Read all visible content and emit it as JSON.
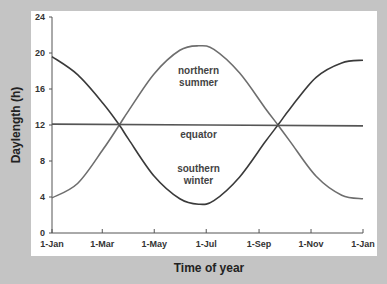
{
  "chart_data": {
    "type": "line",
    "title": "",
    "xlabel": "Time of year",
    "ylabel": "Daylength (h)",
    "x_tick_labels": [
      "1-Jan",
      "1-Mar",
      "1-May",
      "1-Jul",
      "1-Sep",
      "1-Nov",
      "1-Jan"
    ],
    "x_tick_days": [
      0,
      59,
      120,
      181,
      243,
      304,
      365
    ],
    "xlim": [
      0,
      365
    ],
    "y_ticks": [
      0,
      4,
      8,
      12,
      16,
      20,
      24
    ],
    "ylim": [
      0,
      24
    ],
    "grid": false,
    "legend": "none",
    "series": [
      {
        "name": "northern summer",
        "color": "#6e6e6e",
        "x_days": [
          0,
          30,
          60,
          79,
          90,
          120,
          150,
          172,
          190,
          220,
          250,
          266,
          280,
          310,
          340,
          365
        ],
        "values": [
          3.9,
          5.5,
          9.3,
          12.0,
          13.6,
          17.7,
          20.3,
          20.8,
          20.4,
          17.8,
          13.9,
          11.9,
          10.1,
          6.3,
          4.2,
          3.8
        ]
      },
      {
        "name": "southern winter",
        "color": "#3a3a3a",
        "x_days": [
          0,
          30,
          60,
          79,
          90,
          120,
          150,
          172,
          190,
          220,
          250,
          266,
          280,
          310,
          340,
          365
        ],
        "values": [
          19.6,
          17.6,
          14.4,
          12.0,
          10.4,
          6.3,
          3.8,
          3.2,
          3.6,
          6.2,
          10.1,
          12.1,
          13.9,
          17.3,
          18.9,
          19.2
        ]
      },
      {
        "name": "equator",
        "color": "#555555",
        "x_days": [
          0,
          365
        ],
        "values": [
          12.1,
          11.9
        ]
      }
    ],
    "annotations": [
      {
        "text": [
          "northern",
          "summer"
        ],
        "x_day": 172,
        "y": 17.7
      },
      {
        "text": [
          "equator"
        ],
        "x_day": 172,
        "y": 10.6
      },
      {
        "text": [
          "southern",
          "winter"
        ],
        "x_day": 172,
        "y": 6.8
      }
    ]
  }
}
